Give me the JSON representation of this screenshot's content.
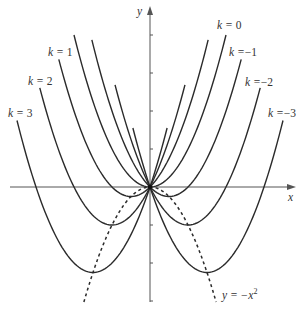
{
  "chart_data": {
    "type": "line",
    "title": "",
    "xlabel": "x",
    "ylabel": "y",
    "xlim": [
      -3.9,
      3.7
    ],
    "ylim": [
      -3.05,
      4.8
    ],
    "grid": false,
    "ticks": {
      "x": [],
      "y": [
        -3,
        -2,
        -1,
        1,
        2,
        3,
        4
      ]
    },
    "series": [
      {
        "name": "k = 3",
        "k": 3,
        "x_range": [
          -3.5,
          0.45
        ],
        "style": "solid"
      },
      {
        "name": "k = 2",
        "k": 2,
        "x_range": [
          -2.9,
          0.92
        ],
        "style": "solid"
      },
      {
        "name": "k = 1",
        "k": 1,
        "x_range": [
          -2.4,
          1.53
        ],
        "style": "solid"
      },
      {
        "name": "k = 0",
        "k": 0,
        "x_range": [
          -2.0,
          2.0
        ],
        "style": "solid"
      },
      {
        "name": "k = −1",
        "k": -1,
        "x_range": [
          -1.53,
          2.4
        ],
        "style": "solid"
      },
      {
        "name": "k = −2",
        "k": -2,
        "x_range": [
          -0.92,
          2.9
        ],
        "style": "solid"
      },
      {
        "name": "k = −3",
        "k": -3,
        "x_range": [
          -0.45,
          3.5
        ],
        "style": "solid"
      },
      {
        "name": "y = −x²",
        "k": null,
        "formula": "-x^2",
        "x_range": [
          -1.74,
          1.74
        ],
        "style": "dashed"
      }
    ],
    "annotations": [
      {
        "text_key": "k3",
        "px": [
          8,
          117
        ]
      },
      {
        "text_key": "k2",
        "px": [
          28,
          85
        ]
      },
      {
        "text_key": "k1",
        "px": [
          48,
          56
        ]
      },
      {
        "text_key": "k0",
        "px": [
          217,
          29
        ]
      },
      {
        "text_key": "km1",
        "px": [
          229,
          56
        ]
      },
      {
        "text_key": "km2",
        "px": [
          245,
          86
        ]
      },
      {
        "text_key": "km3",
        "px": [
          268,
          117
        ]
      }
    ]
  },
  "labels": {
    "y_axis": "y",
    "x_axis": "x",
    "k_eq": "k =",
    "k3": "3",
    "k2": "2",
    "k1": "1",
    "k0": "0",
    "km1": "−1",
    "km2": "−2",
    "km3": "−3",
    "vertex_curve_lhs": "y = −x",
    "vertex_curve_exp": "2"
  },
  "colors": {
    "curve": "#2b2b2b",
    "axis": "#555555",
    "background": "#ffffff"
  }
}
